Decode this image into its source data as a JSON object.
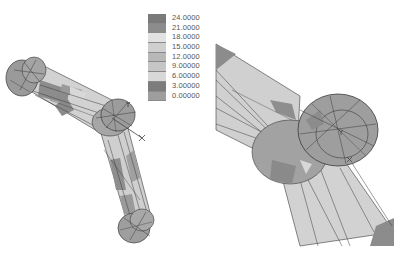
{
  "legend": {
    "entries": [
      {
        "label": "24.0000",
        "color": "#7a7a7a"
      },
      {
        "label": "21.0000",
        "color": "#8c8c8c"
      },
      {
        "label": "18.0000",
        "color": "#e2e2e2"
      },
      {
        "label": "15.0000",
        "color": "#cfcfcf"
      },
      {
        "label": "12.0000",
        "color": "#b8b8b8"
      },
      {
        "label": "9.00000",
        "color": "#c6c6c6"
      },
      {
        "label": "6.00000",
        "color": "#d8d8d8"
      },
      {
        "label": "3.00000",
        "color": "#7c7c7c"
      },
      {
        "label": "0.00000",
        "color": "#9e9e9e"
      }
    ]
  },
  "views": {
    "left": {
      "description": "full linkage contour view",
      "axis_labels": [
        "Y",
        "X"
      ]
    },
    "right": {
      "description": "zoomed joint contour view",
      "axis_labels": [
        "Y",
        "X"
      ]
    }
  },
  "colors": {
    "mesh_line": "#3a3a3a",
    "light_fill": "#d4d4d4",
    "mid_fill": "#a6a6a6",
    "dark_fill": "#8a8a8a"
  }
}
